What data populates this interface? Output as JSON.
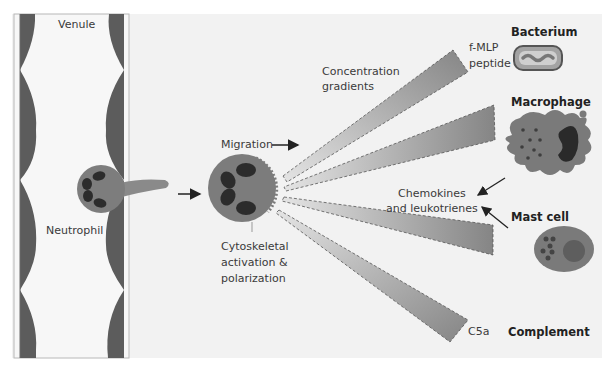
{
  "diagram": {
    "colors": {
      "panel_bg": "#f1f1f1",
      "venule_wall": "#5a5a5a",
      "cell_body": "#7c7c7c",
      "nucleus": "#2e2e2e",
      "gradient_dark": "#8a8a8a",
      "gradient_light": "#e2e2e2",
      "text": "#3a3a3a"
    },
    "labels": {
      "venule": "Venule",
      "neutrophil": "Neutrophil",
      "migration": "Migration",
      "cytoskeletal": "Cytoskeletal\nactivation &\npolarization",
      "concentration_gradients": "Concentration\ngradients",
      "fmlp_peptide": "f-MLP\npeptide",
      "chemokines": "Chemokines\nand leukotrienes",
      "c5a": "C5a"
    },
    "sources": [
      {
        "name": "Bacterium",
        "signal": "f-MLP peptide"
      },
      {
        "name": "Macrophage",
        "signal": "Chemokines and leukotrienes"
      },
      {
        "name": "Mast cell",
        "signal": "Chemokines and leukotrienes"
      },
      {
        "name": "Complement",
        "signal": "C5a"
      }
    ],
    "gradients": [
      {
        "id": "to-bacterium",
        "target": "Bacterium"
      },
      {
        "id": "to-macrophage",
        "target": "Macrophage"
      },
      {
        "id": "to-mast-cell",
        "target": "Mast cell"
      },
      {
        "id": "to-complement",
        "target": "Complement"
      }
    ]
  }
}
